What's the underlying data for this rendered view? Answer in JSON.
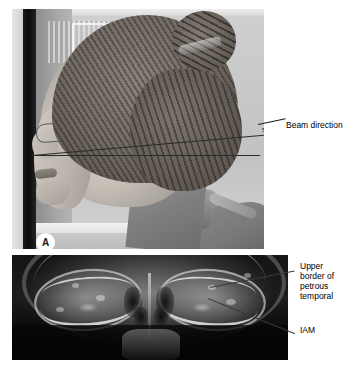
{
  "figure": {
    "type": "radiographic-technique-figure",
    "panels": [
      {
        "id": "A",
        "label": "A",
        "kind": "clinical-photograph",
        "description": "Lateral profile photograph of a patient positioned for a skull radiograph showing the x-ray beam direction"
      },
      {
        "id": "B",
        "label": "B",
        "kind": "radiograph",
        "description": "Occipitofrontal skull radiograph demonstrating the petrous temporal bones within the orbits"
      }
    ]
  },
  "panel_a": {
    "badge_label": "A",
    "angle_label": "5°",
    "callouts": [
      {
        "id": "beam-direction",
        "text": "Beam direction"
      }
    ]
  },
  "panel_b": {
    "badge_label": "B",
    "callouts": [
      {
        "id": "upper-border-petrous-temporal",
        "text": "Upper\nborder of\npetrous\ntemporal"
      },
      {
        "id": "iam",
        "text": "IAM"
      }
    ]
  },
  "colors": {
    "page_background": "#ffffff",
    "annotation_text": "#000000",
    "leader_line": "#3a3a3a",
    "beam_line": "#2b2b2b",
    "badge_fill": "#ffffff",
    "badge_text": "#1a1a1a",
    "radiograph_background": "#050505"
  }
}
